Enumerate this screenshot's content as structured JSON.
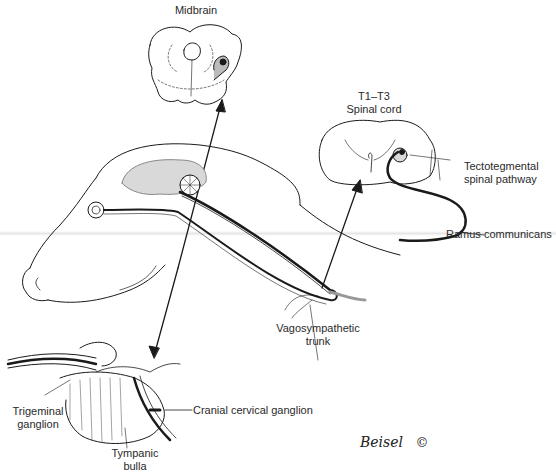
{
  "figure": {
    "labels": {
      "midbrain": "Midbrain",
      "spinal_cord_line1": "T1–T3",
      "spinal_cord_line2": "Spinal cord",
      "tectotegmental_line1": "Tectotegmental",
      "tectotegmental_line2": "spinal pathway",
      "ramus": "Ramus communicans",
      "vagosympathetic_line1": "Vagosympathetic",
      "vagosympathetic_line2": "trunk",
      "trigeminal_line1": "Trigeminal",
      "trigeminal_line2": "ganglion",
      "cranial_cervical": "Cranial cervical ganglion",
      "tympanic_line1": "Tympanic",
      "tympanic_line2": "bulla"
    },
    "signature": "Beisel",
    "copyright": "©",
    "colors": {
      "ink": "#1a1a1a",
      "brain_fill": "#d9d9d9",
      "background": "#ffffff"
    }
  }
}
